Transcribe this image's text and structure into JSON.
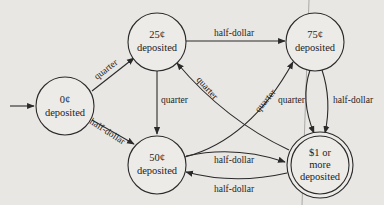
{
  "diagram": {
    "type": "finite-state-machine",
    "start_state": "s0",
    "nodes": [
      {
        "id": "s0",
        "line1": "0¢",
        "line2": "deposited",
        "line3": "",
        "accepting": false
      },
      {
        "id": "s25",
        "line1": "25¢",
        "line2": "deposited",
        "line3": "",
        "accepting": false
      },
      {
        "id": "s75",
        "line1": "75¢",
        "line2": "deposited",
        "line3": "",
        "accepting": false
      },
      {
        "id": "s50",
        "line1": "50¢",
        "line2": "deposited",
        "line3": "",
        "accepting": false
      },
      {
        "id": "s100",
        "line1": "$1 or",
        "line2": "more",
        "line3": "deposited",
        "accepting": true
      }
    ],
    "edges": [
      {
        "from": "s0",
        "to": "s25",
        "label": "quarter"
      },
      {
        "from": "s0",
        "to": "s50",
        "label": "half-dollar"
      },
      {
        "from": "s25",
        "to": "s75",
        "label": "half-dollar"
      },
      {
        "from": "s25",
        "to": "s50",
        "label": "quarter"
      },
      {
        "from": "s100",
        "to": "s25",
        "label": "quarter"
      },
      {
        "from": "s50",
        "to": "s75",
        "label": "quarter"
      },
      {
        "from": "s75",
        "to": "s100",
        "label": "quarter"
      },
      {
        "from": "s75",
        "to": "s100",
        "label": "half-dollar"
      },
      {
        "from": "s50",
        "to": "s100",
        "label": "half-dollar"
      },
      {
        "from": "s100",
        "to": "s50",
        "label": "half-dollar"
      }
    ]
  }
}
